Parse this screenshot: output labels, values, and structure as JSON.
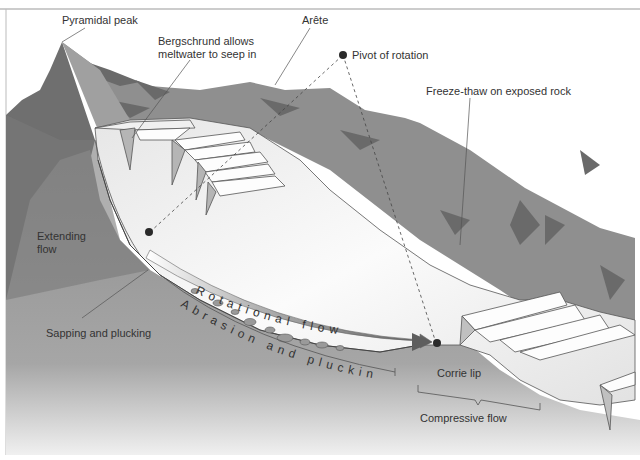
{
  "colors": {
    "rock_dark": "#6e6e6e",
    "rock_mid": "#8a8a8a",
    "rock_light": "#a8a8a8",
    "rock_streak": "#5c5c5c",
    "ice_white": "#f7f7f7",
    "ice_shade": "#d9d9d9",
    "arrow_gray": "#6a6a6a",
    "pivot_dot": "#2a2a2a",
    "text": "#333333",
    "frame": "#999999"
  },
  "labels": {
    "pyramidal_peak": "Pyramidal peak",
    "bergschrund_line1": "Bergschrund allows",
    "bergschrund_line2": "meltwater to seep in",
    "arete": "Arête",
    "pivot": "Pivot of rotation",
    "freeze_thaw": "Freeze-thaw on exposed rock",
    "extending_line1": "Extending",
    "extending_line2": "flow",
    "sapping": "Sapping and plucking",
    "rotational_flow": "Rotational flow",
    "abrasion": "Abrasion and plucking",
    "corrie_lip": "Corrie lip",
    "compressive_flow": "Compressive flow"
  }
}
